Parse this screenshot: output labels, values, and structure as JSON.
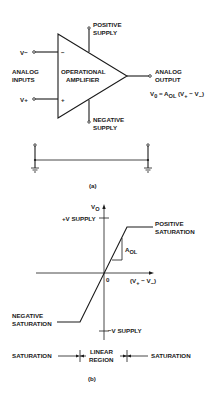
{
  "figure_a": {
    "caption": "(a)",
    "block_label_line1": "OPERATIONAL",
    "block_label_line2": "AMPLIFIER",
    "inverting_input": "V−",
    "noninverting_input": "V+",
    "inverting_sign": "−",
    "noninverting_sign": "+",
    "inputs_label_line1": "ANALOG",
    "inputs_label_line2": "INPUTS",
    "positive_supply_line1": "POSITIVE",
    "positive_supply_line2": "SUPPLY",
    "negative_supply_line1": "NEGATIVE",
    "negative_supply_line2": "SUPPLY",
    "output_label_line1": "ANALOG",
    "output_label_line2": "OUTPUT",
    "equation": "V0 = AOL (V+ − V−)"
  },
  "figure_b": {
    "caption": "(b)",
    "y_axis_label": "VO",
    "x_axis_label": "(V+ − V−)",
    "origin_label": "0",
    "pos_supply_label": "+V SUPPLY",
    "neg_supply_label": "−V SUPPLY",
    "pos_sat_line1": "POSITIVE",
    "pos_sat_line2": "SATURATION",
    "neg_sat_line1": "NEGATIVE",
    "neg_sat_line2": "SATURATION",
    "slope_label": "AOL",
    "region_left": "SATURATION",
    "region_mid_line1": "LINEAR",
    "region_mid_line2": "REGION",
    "region_right": "SATURATION"
  }
}
